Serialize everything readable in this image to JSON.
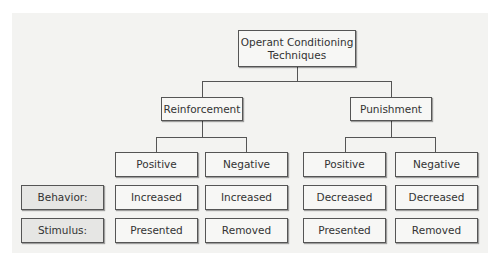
{
  "diagram": {
    "root": {
      "line1": "Operant Conditioning",
      "line2": "Techniques"
    },
    "categories": [
      {
        "label": "Reinforcement",
        "children": [
          {
            "label": "Positive",
            "behavior": "Increased",
            "stimulus": "Presented"
          },
          {
            "label": "Negative",
            "behavior": "Increased",
            "stimulus": "Removed"
          }
        ]
      },
      {
        "label": "Punishment",
        "children": [
          {
            "label": "Positive",
            "behavior": "Decreased",
            "stimulus": "Presented"
          },
          {
            "label": "Negative",
            "behavior": "Decreased",
            "stimulus": "Removed"
          }
        ]
      }
    ],
    "row_labels": {
      "behavior": "Behavior:",
      "stimulus": "Stimulus:"
    }
  }
}
